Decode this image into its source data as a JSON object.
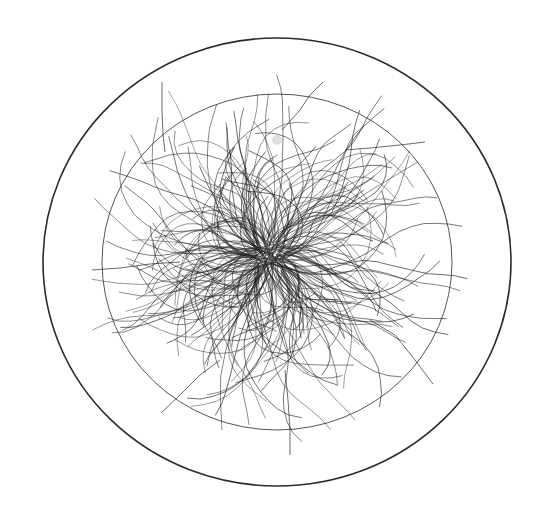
{
  "illustration": {
    "description": "Tangled mass of wavy dark strands radiating from a dense center, enclosed by two concentric circles",
    "background": "#ffffff",
    "center": {
      "x": 268,
      "y": 256
    },
    "outer_circle": {
      "cx": 277,
      "cy": 262,
      "rx": 234,
      "ry": 224,
      "stroke": "#2a2a2a",
      "stroke_width": 1.6
    },
    "inner_circle": {
      "cx": 277,
      "cy": 262,
      "rx": 175,
      "ry": 168,
      "stroke": "#555555",
      "stroke_width": 1.0
    },
    "strands": {
      "count": 260,
      "color": "#222222",
      "opacity": 0.75,
      "stroke_width": 0.9,
      "min_length": 60,
      "max_length": 190,
      "waviness": 0.55,
      "seed": 42
    },
    "notable_strands": [
      {
        "points": [
          [
            162,
            82
          ],
          [
            162,
            110
          ],
          [
            163,
            135
          ],
          [
            165,
            152
          ]
        ]
      },
      {
        "points": [
          [
            323,
            82
          ],
          [
            310,
            95
          ],
          [
            300,
            110
          ],
          [
            282,
            130
          ]
        ]
      },
      {
        "points": [
          [
            425,
            142
          ],
          [
            400,
            145
          ],
          [
            370,
            148
          ],
          [
            345,
            150
          ]
        ]
      },
      {
        "points": [
          [
            433,
            384
          ],
          [
            415,
            360
          ],
          [
            395,
            335
          ],
          [
            370,
            320
          ]
        ]
      },
      {
        "points": [
          [
            92,
            270
          ],
          [
            120,
            268
          ],
          [
            150,
            264
          ],
          [
            180,
            262
          ]
        ]
      },
      {
        "points": [
          [
            161,
            413
          ],
          [
            180,
            395
          ],
          [
            200,
            375
          ],
          [
            220,
            360
          ]
        ]
      },
      {
        "points": [
          [
            290,
            455
          ],
          [
            290,
            430
          ],
          [
            288,
            400
          ],
          [
            285,
            370
          ]
        ]
      }
    ],
    "smudge": {
      "x": 277,
      "y": 140,
      "r": 5,
      "color": "#bbbbbb"
    }
  }
}
